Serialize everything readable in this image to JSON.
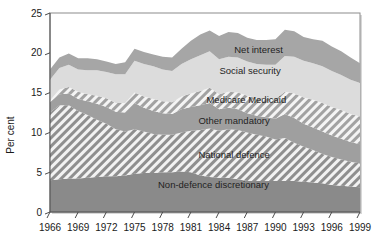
{
  "chart_data": {
    "type": "area",
    "stacked": true,
    "title": "",
    "subtitle": "",
    "xlabel": "",
    "ylabel": "Per cent",
    "xlim": [
      1966,
      1999
    ],
    "ylim": [
      0,
      25
    ],
    "yticks": [
      0,
      5,
      10,
      15,
      20,
      25
    ],
    "xticks": [
      1966,
      1969,
      1972,
      1975,
      1978,
      1981,
      1984,
      1987,
      1990,
      1993,
      1996,
      1999
    ],
    "grid": false,
    "legend_position": "inline-labels",
    "x": [
      1966,
      1967,
      1968,
      1969,
      1970,
      1971,
      1972,
      1973,
      1974,
      1975,
      1976,
      1977,
      1978,
      1979,
      1980,
      1981,
      1982,
      1983,
      1984,
      1985,
      1986,
      1987,
      1988,
      1989,
      1990,
      1991,
      1992,
      1993,
      1994,
      1995,
      1996,
      1997,
      1998,
      1999
    ],
    "series": [
      {
        "name": "Non-defence discretionary",
        "fill": "#8a8a8a",
        "pattern": "solid",
        "values": [
          4.0,
          4.1,
          4.2,
          4.2,
          4.3,
          4.4,
          4.5,
          4.5,
          4.6,
          4.8,
          4.9,
          4.9,
          5.0,
          5.0,
          5.1,
          5.0,
          4.6,
          4.4,
          4.3,
          4.3,
          4.1,
          3.9,
          3.9,
          3.9,
          3.9,
          3.9,
          3.9,
          3.8,
          3.7,
          3.6,
          3.4,
          3.3,
          3.2,
          3.1
        ]
      },
      {
        "name": "National defence",
        "fill": "#9a9a9a",
        "pattern": "diagonal-hatch",
        "values": [
          8.5,
          9.3,
          9.2,
          8.5,
          7.9,
          7.2,
          6.6,
          5.9,
          5.5,
          5.6,
          5.2,
          4.9,
          4.7,
          4.7,
          4.9,
          5.2,
          5.7,
          6.1,
          5.9,
          6.1,
          6.2,
          6.1,
          5.8,
          5.6,
          5.2,
          5.4,
          4.8,
          4.4,
          4.1,
          3.7,
          3.5,
          3.3,
          3.1,
          3.0
        ]
      },
      {
        "name": "Other mandatory",
        "fill": "#9f9f9f",
        "pattern": "solid",
        "values": [
          1.3,
          1.4,
          1.5,
          1.5,
          1.7,
          2.0,
          2.1,
          2.2,
          2.4,
          3.3,
          3.0,
          2.9,
          2.7,
          2.6,
          2.9,
          3.0,
          3.1,
          3.2,
          2.7,
          2.7,
          2.6,
          2.4,
          2.4,
          2.4,
          2.6,
          3.0,
          3.1,
          2.9,
          2.8,
          2.8,
          2.7,
          2.6,
          2.5,
          2.4
        ]
      },
      {
        "name": "Medicare Medicaid",
        "fill": "#adadad",
        "pattern": "diagonal-hatch",
        "values": [
          0.2,
          0.6,
          0.8,
          0.9,
          0.9,
          1.0,
          1.1,
          1.1,
          1.2,
          1.3,
          1.4,
          1.5,
          1.5,
          1.5,
          1.6,
          1.7,
          1.8,
          1.9,
          1.9,
          2.0,
          2.1,
          2.2,
          2.2,
          2.4,
          2.5,
          2.8,
          3.1,
          3.3,
          3.5,
          3.6,
          3.6,
          3.6,
          3.5,
          3.5
        ]
      },
      {
        "name": "Social security",
        "fill": "#dcdcdc",
        "pattern": "solid",
        "values": [
          2.6,
          2.7,
          2.8,
          2.8,
          3.0,
          3.2,
          3.3,
          3.6,
          3.6,
          4.0,
          4.1,
          4.1,
          4.0,
          3.9,
          4.1,
          4.3,
          4.5,
          4.6,
          4.4,
          4.4,
          4.4,
          4.3,
          4.3,
          4.2,
          4.3,
          4.5,
          4.6,
          4.6,
          4.6,
          4.6,
          4.5,
          4.4,
          4.3,
          4.2
        ]
      },
      {
        "name": "Net interest",
        "fill": "#a6a6a6",
        "pattern": "solid",
        "values": [
          1.3,
          1.3,
          1.4,
          1.4,
          1.5,
          1.4,
          1.3,
          1.3,
          1.5,
          1.5,
          1.5,
          1.5,
          1.6,
          1.7,
          1.9,
          2.3,
          2.6,
          2.6,
          2.9,
          3.1,
          3.1,
          3.0,
          3.0,
          3.1,
          3.2,
          3.3,
          3.2,
          3.0,
          3.0,
          3.2,
          3.1,
          3.0,
          2.8,
          2.5
        ]
      }
    ],
    "series_label_positions": [
      {
        "name": "Net interest",
        "x": 1988.2,
        "y": 20.0
      },
      {
        "name": "Social security",
        "x": 1987.3,
        "y": 17.3
      },
      {
        "name": "Medicare Medicaid",
        "x": 1986.9,
        "y": 13.7
      },
      {
        "name": "Other mandatory",
        "x": 1985.6,
        "y": 11.1
      },
      {
        "name": "National defence",
        "x": 1985.6,
        "y": 6.8
      },
      {
        "name": "Non-defence discretionary",
        "x": 1983.4,
        "y": 3.0
      }
    ]
  },
  "axes": {
    "y_title": "Per cent",
    "y_tick_labels": [
      "0",
      "5",
      "10",
      "15",
      "20",
      "25"
    ],
    "x_tick_labels": [
      "1966",
      "1969",
      "1972",
      "1975",
      "1978",
      "1981",
      "1984",
      "1987",
      "1990",
      "1993",
      "1996",
      "1999"
    ]
  },
  "colors": {
    "background": "#ffffff",
    "axis": "#4d4d4d",
    "text": "#1a1a1a",
    "non_defence_discretionary": "#8a8a8a",
    "national_defence": "#9a9a9a",
    "other_mandatory": "#9f9f9f",
    "medicare_medicaid": "#adadad",
    "social_security": "#dcdcdc",
    "net_interest": "#a6a6a6"
  }
}
